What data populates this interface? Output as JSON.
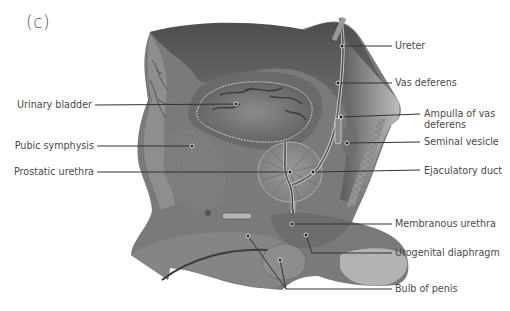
{
  "figure": {
    "panel_label": "(c)",
    "colors": {
      "background": "#ffffff",
      "tissue_dark": "#5a5a5a",
      "tissue_mid": "#7a7a7a",
      "tissue_light": "#a5a5a5",
      "leader_line": "#333333",
      "label_text": "#4a4a4a"
    },
    "labels_left": [
      {
        "id": "urinary-bladder",
        "text": "Urinary bladder"
      },
      {
        "id": "pubic-symphysis",
        "text": "Pubic symphysis"
      },
      {
        "id": "prostatic-urethra",
        "text": "Prostatic urethra"
      }
    ],
    "labels_right": [
      {
        "id": "ureter",
        "text": "Ureter"
      },
      {
        "id": "vas-deferens",
        "text": "Vas deferens"
      },
      {
        "id": "ampulla-of-vas-deferens",
        "text": "Ampulla of vas deferens",
        "line1": "Ampulla of vas",
        "line2": "deferens"
      },
      {
        "id": "seminal-vesicle",
        "text": "Seminal vesicle"
      },
      {
        "id": "ejaculatory-duct",
        "text": "Ejaculatory duct"
      },
      {
        "id": "membranous-urethra",
        "text": "Membranous urethra"
      },
      {
        "id": "urogenital-diaphragm",
        "text": "Urogenital diaphragm"
      },
      {
        "id": "bulb-of-penis",
        "text": "Bulb of penis"
      }
    ]
  }
}
